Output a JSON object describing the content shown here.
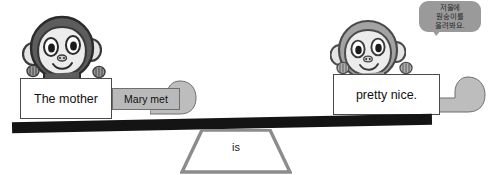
{
  "scene": {
    "title": "grammar-balance-seesaw",
    "colors": {
      "beam": "#141414",
      "fulcrum_border": "#8c8c8c",
      "sign_fill": "#ffffff",
      "sign_border": "#4a4a4a",
      "tailcard_fill": "#b9b9b9",
      "tail_fill": "#bdbdbd",
      "monkey_left_head": "#5d5d5d",
      "monkey_right_head": "#a3a3a3",
      "monkey_face": "#e8e8e8",
      "bubble_fill": "#9a9a9a"
    }
  },
  "fulcrum": {
    "label": "is"
  },
  "signs": {
    "left": {
      "text": "The mother"
    },
    "right": {
      "text": "pretty nice."
    }
  },
  "tailcard": {
    "text": "Mary met"
  },
  "bubble": {
    "lines": [
      "저울에",
      "원숭이를",
      "올려봐요."
    ]
  },
  "monkeys": [
    {
      "id": "monkey-left",
      "side": "left",
      "shade": "dark"
    },
    {
      "id": "monkey-right",
      "side": "right",
      "shade": "light"
    }
  ]
}
